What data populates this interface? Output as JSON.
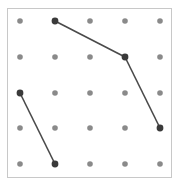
{
  "canvas": {
    "width": 173,
    "height": 188
  },
  "frame": {
    "x": 7,
    "y": 8,
    "width": 165,
    "height": 170,
    "stroke": "#c8c8c8"
  },
  "grid": {
    "columns": 5,
    "rows": 5,
    "x": [
      20,
      55,
      90,
      125,
      160
    ],
    "y": [
      21,
      57,
      93,
      128,
      164
    ],
    "dot_color": "#8a8a8a",
    "dot_radius": 2.8
  },
  "segments": [
    {
      "from": [
        1,
        0
      ],
      "to": [
        3,
        1
      ]
    },
    {
      "from": [
        3,
        1
      ],
      "to": [
        4,
        3
      ]
    },
    {
      "from": [
        0,
        2
      ],
      "to": [
        1,
        4
      ]
    }
  ],
  "line_color": "#4a4a4a",
  "endpoint_color": "#3a3a3a",
  "endpoint_radius": 3.4
}
